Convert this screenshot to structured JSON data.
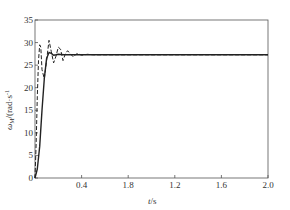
{
  "chart_data": {
    "type": "line",
    "title": "",
    "xlabel": "t/s",
    "ylabel": "ω_M/(rad·s⁻¹)",
    "ylabel_parts": {
      "symbol": "ω",
      "sub": "M",
      "unit": "/(rad·s",
      "exp": "-1",
      "close": ")"
    },
    "xlim": [
      0,
      2.0
    ],
    "ylim": [
      0,
      35
    ],
    "x_ticks": [
      0,
      0.4,
      0.8,
      1.2,
      1.6,
      2.0
    ],
    "x_tick_labels": [
      "",
      "0.4",
      "1.8",
      "1.2",
      "1.6",
      "2.0"
    ],
    "y_ticks": [
      0,
      5,
      10,
      15,
      20,
      25,
      30,
      35
    ],
    "y_tick_labels": [
      "0",
      "5",
      "10",
      "15",
      "20",
      "25",
      "30",
      "35"
    ],
    "grid": false,
    "legend": null,
    "series": [
      {
        "name": "solid",
        "style": "solid",
        "x": [
          0,
          0.02,
          0.04,
          0.06,
          0.08,
          0.1,
          0.12,
          0.14,
          0.16,
          0.18,
          0.2,
          0.25,
          0.3,
          0.4,
          0.6,
          1.0,
          2.0
        ],
        "values": [
          0,
          2,
          7,
          15,
          22,
          26.5,
          27.8,
          27.6,
          27.2,
          27.3,
          27.4,
          27.3,
          27.3,
          27.3,
          27.3,
          27.3,
          27.3
        ]
      },
      {
        "name": "dashed",
        "style": "dashed",
        "x": [
          0,
          0.01,
          0.02,
          0.03,
          0.04,
          0.05,
          0.06,
          0.08,
          0.1,
          0.12,
          0.14,
          0.16,
          0.18,
          0.2,
          0.22,
          0.24,
          0.26,
          0.28,
          0.3,
          0.33,
          0.36,
          0.4,
          0.45,
          0.5,
          0.6,
          1.0,
          2.0
        ],
        "values": [
          0,
          8,
          18,
          26,
          29.5,
          29,
          24,
          22,
          26,
          30.5,
          28,
          25.5,
          27,
          29,
          28.5,
          26,
          27.5,
          28.2,
          27.6,
          26.8,
          27.6,
          27.2,
          27.4,
          27.3,
          27.3,
          27.3,
          27.3
        ]
      }
    ]
  }
}
